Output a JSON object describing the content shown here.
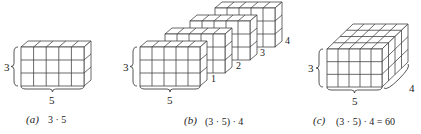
{
  "figure": {
    "panels": [
      {
        "id": "a",
        "label": "(a)",
        "expression": "3 · 5",
        "dims": {
          "height": "3",
          "width": "5"
        },
        "rows": 3,
        "cols": 5,
        "layers": 1
      },
      {
        "id": "b",
        "label": "(b)",
        "expression": "(3 · 5) · 4",
        "dims": {
          "height": "3",
          "width": "5"
        },
        "layer_labels": [
          "1",
          "2",
          "3",
          "4"
        ],
        "rows": 3,
        "cols": 5,
        "layers": 4
      },
      {
        "id": "c",
        "label": "(c)",
        "expression": "(3 · 5) · 4 = 60",
        "dims": {
          "height": "3",
          "width": "5",
          "depth": "4"
        },
        "rows": 3,
        "cols": 5,
        "layers": 4
      }
    ],
    "colors": {
      "line": "#444444",
      "face": "#ffffff",
      "text": "#222222"
    }
  }
}
